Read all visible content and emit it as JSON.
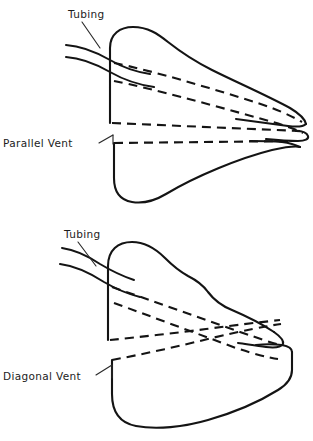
{
  "figure": {
    "background_color": "#ffffff",
    "line_color": "#141414",
    "panels": [
      {
        "id": "parallel-vent-panel",
        "name": "parallel-vent-diagram",
        "labels": [
          {
            "id": "tubing",
            "text": "Tubing"
          },
          {
            "id": "vent",
            "text": "Parallel Vent"
          }
        ]
      },
      {
        "id": "diagonal-vent-panel",
        "name": "diagonal-vent-diagram",
        "labels": [
          {
            "id": "tubing",
            "text": "Tubing"
          },
          {
            "id": "vent",
            "text": "Diagonal Vent"
          }
        ]
      }
    ]
  },
  "labels": {
    "top_tubing": "Tubing",
    "parallel_vent": "Parallel Vent",
    "bottom_tubing": "Tubing",
    "diagonal_vent": "Diagonal Vent"
  }
}
